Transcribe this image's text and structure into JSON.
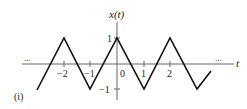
{
  "figure": {
    "panel_label": "(i)",
    "y_axis_label": "x(t)",
    "x_axis_label": "t",
    "ellipsis_left": "...",
    "ellipsis_right": "...",
    "y_ticks": [
      {
        "value": 1,
        "label": "1"
      },
      {
        "value": -1,
        "label": "−1"
      }
    ],
    "x_ticks": [
      {
        "value": -2,
        "label": "−2"
      },
      {
        "value": -1,
        "label": "−1"
      },
      {
        "value": 0,
        "label": "0"
      },
      {
        "value": 1,
        "label": "1"
      },
      {
        "value": 2,
        "label": "2"
      }
    ],
    "signal": {
      "description": "periodic triangular wave, period 2, peaks of 1 at even t, troughs of -1 at odd t",
      "points": [
        [
          -3.5,
          -1
        ],
        [
          -2,
          1
        ],
        [
          -1,
          -1
        ],
        [
          0,
          1
        ],
        [
          1,
          -1
        ],
        [
          2,
          1
        ],
        [
          3,
          -1
        ],
        [
          3.5,
          -0.5
        ]
      ]
    },
    "colors": {
      "stroke": "#111111",
      "axis": "#555555",
      "background": "#ffffff"
    }
  }
}
